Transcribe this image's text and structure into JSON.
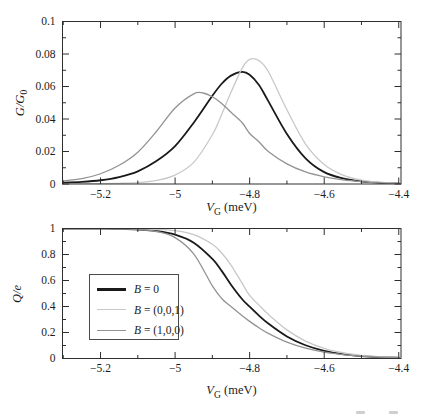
{
  "labels": {
    "xlabel": {
      "var": "V",
      "sub": "G",
      "rest": " (meV)"
    },
    "ylabel_top": {
      "main": "G/G",
      "sub": "0"
    },
    "ylabel_bottom": {
      "main": "Q/e"
    }
  },
  "colors": {
    "black_curve": "#1a1a1a",
    "light_gray_curve": "#c8c8c8",
    "gray_curve": "#939393",
    "frame": "#2e2e2e",
    "text": "#1c1c1c"
  },
  "chart_data": [
    {
      "type": "line",
      "title": "",
      "xlabel": "V_G (meV)",
      "ylabel": "G/G_0",
      "xlim": [
        -5.302,
        -4.394
      ],
      "ylim": [
        0,
        0.1
      ],
      "grid": false,
      "xticks": {
        "values": [
          -5.2,
          -5.0,
          -4.8,
          -4.6,
          -4.4
        ],
        "labels": [
          "−5.2",
          "−5",
          "−4.8",
          "−4.6",
          "−4.4"
        ]
      },
      "xticks_minor": [
        -5.3,
        -5.1,
        -4.9,
        -4.7,
        -4.5
      ],
      "yticks": {
        "values": [
          0,
          0.02,
          0.04,
          0.06,
          0.08,
          0.1
        ],
        "labels": [
          "0",
          "0.02",
          "0.04",
          "0.06",
          "0.08",
          "0.1"
        ]
      },
      "yticks_minor": [
        0.01,
        0.03,
        0.05,
        0.07,
        0.09
      ],
      "series": [
        {
          "name": "B = 0",
          "color": "#1a1a1a",
          "width": 1.8,
          "x": [
            -5.31,
            -5.25,
            -5.2,
            -5.15,
            -5.1,
            -5.05,
            -5.0,
            -4.95,
            -4.9,
            -4.875,
            -4.85,
            -4.82,
            -4.8,
            -4.775,
            -4.75,
            -4.7,
            -4.65,
            -4.6,
            -4.55,
            -4.5,
            -4.45,
            -4.4
          ],
          "y": [
            0.0007,
            0.0013,
            0.0023,
            0.0043,
            0.0078,
            0.0141,
            0.0233,
            0.0377,
            0.0543,
            0.0617,
            0.0667,
            0.069,
            0.0672,
            0.0609,
            0.051,
            0.0308,
            0.0158,
            0.0073,
            0.0035,
            0.0016,
            0.0007,
            0.0003
          ]
        },
        {
          "name": "B = (0,0,1)",
          "color": "#c8c8c8",
          "width": 1.3,
          "x": [
            -5.31,
            -5.25,
            -5.2,
            -5.15,
            -5.1,
            -5.05,
            -5.0,
            -4.95,
            -4.9,
            -4.875,
            -4.85,
            -4.82,
            -4.8,
            -4.775,
            -4.75,
            -4.7,
            -4.65,
            -4.6,
            -4.55,
            -4.5,
            -4.45,
            -4.4
          ],
          "y": [
            0.0,
            0.0001,
            0.0002,
            0.0004,
            0.0008,
            0.0022,
            0.0055,
            0.0133,
            0.0303,
            0.0428,
            0.0564,
            0.0713,
            0.0767,
            0.0759,
            0.0692,
            0.0457,
            0.0246,
            0.012,
            0.0055,
            0.0024,
            0.0011,
            0.0005
          ]
        },
        {
          "name": "B = (1,0,0)",
          "color": "#939393",
          "width": 1.3,
          "x": [
            -5.31,
            -5.25,
            -5.2,
            -5.15,
            -5.1,
            -5.05,
            -5.0,
            -4.95,
            -4.925,
            -4.9,
            -4.875,
            -4.85,
            -4.82,
            -4.8,
            -4.775,
            -4.75,
            -4.7,
            -4.65,
            -4.6,
            -4.55,
            -4.5,
            -4.45,
            -4.4
          ],
          "y": [
            0.0017,
            0.0033,
            0.0063,
            0.0115,
            0.0196,
            0.0323,
            0.0468,
            0.0555,
            0.056,
            0.0537,
            0.0496,
            0.0441,
            0.0377,
            0.0311,
            0.026,
            0.02,
            0.0124,
            0.0074,
            0.0044,
            0.0025,
            0.0014,
            0.0007,
            0.0004
          ]
        }
      ]
    },
    {
      "type": "line",
      "title": "",
      "xlabel": "V_G (meV)",
      "ylabel": "Q/e",
      "xlim": [
        -5.302,
        -4.394
      ],
      "ylim": [
        0,
        1
      ],
      "grid": false,
      "xticks": {
        "values": [
          -5.2,
          -5.0,
          -4.8,
          -4.6,
          -4.4
        ],
        "labels": [
          "−5.2",
          "−5",
          "−4.8",
          "−4.6",
          "−4.4"
        ]
      },
      "xticks_minor": [
        -5.3,
        -5.1,
        -4.9,
        -4.7,
        -4.5
      ],
      "yticks": {
        "values": [
          0,
          0.2,
          0.4,
          0.6,
          0.8,
          1
        ],
        "labels": [
          "0",
          "0.2",
          "0.4",
          "0.6",
          "0.8",
          "1"
        ]
      },
      "yticks_minor": [
        0.1,
        0.3,
        0.5,
        0.7,
        0.9
      ],
      "legend": {
        "position": "center-left",
        "entries": [
          {
            "label": "B = 0",
            "var": "B",
            "rest": " = 0",
            "color": "#1a1a1a",
            "sample_thickness": "2.6px"
          },
          {
            "label": "B = (0,0,1)",
            "var": "B",
            "rest": " = (0,0,1)",
            "color": "#c8c8c8",
            "sample_thickness": "1.4px"
          },
          {
            "label": "B = (1,0,0)",
            "var": "B",
            "rest": " = (1,0,0)",
            "color": "#939393",
            "sample_thickness": "1.4px"
          }
        ]
      },
      "series": [
        {
          "name": "B = 0",
          "color": "#1a1a1a",
          "width": 1.8,
          "x": [
            -5.31,
            -5.25,
            -5.2,
            -5.15,
            -5.1,
            -5.05,
            -5.0,
            -4.95,
            -4.9,
            -4.875,
            -4.85,
            -4.82,
            -4.8,
            -4.775,
            -4.75,
            -4.7,
            -4.65,
            -4.6,
            -4.55,
            -4.5,
            -4.45,
            -4.4
          ],
          "y": [
            0.9998,
            0.9995,
            0.9987,
            0.9968,
            0.9921,
            0.9803,
            0.9525,
            0.8903,
            0.7655,
            0.6741,
            0.5676,
            0.456,
            0.3982,
            0.3301,
            0.2689,
            0.1697,
            0.1019,
            0.0593,
            0.0338,
            0.019,
            0.0107,
            0.006
          ]
        },
        {
          "name": "B = (0,0,1)",
          "color": "#c8c8c8",
          "width": 1.3,
          "x": [
            -5.31,
            -5.25,
            -5.2,
            -5.15,
            -5.1,
            -5.05,
            -5.0,
            -4.95,
            -4.9,
            -4.875,
            -4.85,
            -4.82,
            -4.8,
            -4.775,
            -4.75,
            -4.7,
            -4.65,
            -4.6,
            -4.55,
            -4.5,
            -4.45,
            -4.4
          ],
          "y": [
            1.0,
            0.9999,
            0.9997,
            0.9993,
            0.9979,
            0.994,
            0.9831,
            0.9532,
            0.8786,
            0.8113,
            0.7187,
            0.5776,
            0.485,
            0.4107,
            0.34,
            0.22,
            0.1338,
            0.078,
            0.0443,
            0.0247,
            0.0137,
            0.0075
          ]
        },
        {
          "name": "B = (1,0,0)",
          "color": "#939393",
          "width": 1.3,
          "x": [
            -5.31,
            -5.25,
            -5.2,
            -5.15,
            -5.1,
            -5.05,
            -5.0,
            -4.95,
            -4.9,
            -4.875,
            -4.85,
            -4.82,
            -4.8,
            -4.775,
            -4.75,
            -4.7,
            -4.65,
            -4.6,
            -4.55,
            -4.5,
            -4.45,
            -4.4
          ],
          "y": [
            0.9999,
            0.9998,
            0.9993,
            0.9978,
            0.9928,
            0.9769,
            0.9301,
            0.8041,
            0.5587,
            0.4618,
            0.3993,
            0.3287,
            0.2854,
            0.2363,
            0.1933,
            0.1258,
            0.0795,
            0.0493,
            0.0302,
            0.0183,
            0.0111,
            0.0067
          ]
        }
      ]
    }
  ]
}
